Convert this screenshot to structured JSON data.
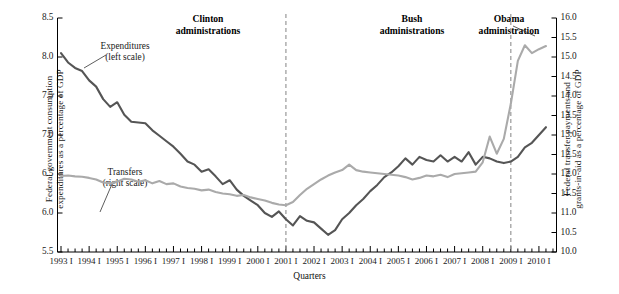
{
  "figure": {
    "xaxis_title": "Quarters"
  },
  "axes": {
    "left": {
      "title_line1": "Federal government consumption",
      "title_line2": "expenditures as a percentage of GDP",
      "ticks": [
        "5.5",
        "6.0",
        "6.5",
        "7.0",
        "7.5",
        "8.0",
        "8.5"
      ]
    },
    "right": {
      "title_line1": "Federal transfer payments and",
      "title_line2": "grants-in-aid as a percentage of GDP",
      "ticks": [
        "10.0",
        "10.5",
        "11.0",
        "11.5",
        "12.0",
        "12.5",
        "13.0",
        "13.5",
        "14.0",
        "14.5",
        "15.0",
        "15.5",
        "16.0"
      ]
    },
    "x": {
      "ticks": [
        "1993 I",
        "1994 I",
        "1995 I",
        "1996 I",
        "1997 I",
        "1998 I",
        "1999 I",
        "2000 I",
        "2001 I",
        "2002 I",
        "2003 I",
        "2004 I",
        "2005 I",
        "2006 I",
        "2007 I",
        "2008 I",
        "2009 I",
        "2010 I"
      ]
    }
  },
  "annotations": {
    "eras": [
      {
        "name": "clinton",
        "line1": "Clinton",
        "line2": "administrations"
      },
      {
        "name": "bush",
        "line1": "Bush",
        "line2": "administrations"
      },
      {
        "name": "obama",
        "line1": "Obama",
        "line2": "administration"
      }
    ],
    "callouts": [
      {
        "name": "expenditures",
        "line1": "Expenditures",
        "line2": "(left scale)"
      },
      {
        "name": "transfers",
        "line1": "Transfers",
        "line2": "(right scale)"
      }
    ],
    "dividers": [
      "2001 I",
      "2009 I"
    ]
  },
  "colors": {
    "expenditures": "#555555",
    "transfers": "#aaaaaa",
    "axis": "#000000",
    "divider": "#999999"
  },
  "chart_data": {
    "type": "line",
    "title": "",
    "xlabel": "Quarters",
    "ylabel": "Federal government consumption expenditures as a percentage of GDP",
    "y2label": "Federal transfer payments and grants-in-aid as a percentage of GDP",
    "ylim": [
      5.5,
      8.5
    ],
    "y2lim": [
      10.0,
      16.0
    ],
    "grid": false,
    "legend": "inline-callouts",
    "x": [
      "1993 I",
      "1993 II",
      "1993 III",
      "1993 IV",
      "1994 I",
      "1994 II",
      "1994 III",
      "1994 IV",
      "1995 I",
      "1995 II",
      "1995 III",
      "1995 IV",
      "1996 I",
      "1996 II",
      "1996 III",
      "1996 IV",
      "1997 I",
      "1997 II",
      "1997 III",
      "1997 IV",
      "1998 I",
      "1998 II",
      "1998 III",
      "1998 IV",
      "1999 I",
      "1999 II",
      "1999 III",
      "1999 IV",
      "2000 I",
      "2000 II",
      "2000 III",
      "2000 IV",
      "2001 I",
      "2001 II",
      "2001 III",
      "2001 IV",
      "2002 I",
      "2002 II",
      "2002 III",
      "2002 IV",
      "2003 I",
      "2003 II",
      "2003 III",
      "2003 IV",
      "2004 I",
      "2004 II",
      "2004 III",
      "2004 IV",
      "2005 I",
      "2005 II",
      "2005 III",
      "2005 IV",
      "2006 I",
      "2006 II",
      "2006 III",
      "2006 IV",
      "2007 I",
      "2007 II",
      "2007 III",
      "2007 IV",
      "2008 I",
      "2008 II",
      "2008 III",
      "2008 IV",
      "2009 I",
      "2009 II",
      "2009 III",
      "2009 IV",
      "2010 I",
      "2010 II"
    ],
    "series": [
      {
        "name": "Expenditures (left scale)",
        "axis": "left",
        "color": "#555555",
        "values": [
          8.05,
          7.93,
          7.86,
          7.82,
          7.7,
          7.62,
          7.46,
          7.36,
          7.42,
          7.26,
          7.17,
          7.16,
          7.15,
          7.06,
          6.99,
          6.92,
          6.85,
          6.76,
          6.66,
          6.62,
          6.53,
          6.56,
          6.47,
          6.37,
          6.42,
          6.3,
          6.22,
          6.16,
          6.1,
          6.0,
          5.95,
          6.02,
          5.92,
          5.84,
          5.96,
          5.9,
          5.88,
          5.8,
          5.72,
          5.78,
          5.92,
          6.0,
          6.1,
          6.18,
          6.28,
          6.36,
          6.46,
          6.52,
          6.6,
          6.7,
          6.62,
          6.72,
          6.68,
          6.66,
          6.74,
          6.66,
          6.72,
          6.66,
          6.78,
          6.62,
          6.72,
          6.7,
          6.66,
          6.64,
          6.66,
          6.72,
          6.84,
          6.9,
          7.0,
          7.1
        ]
      },
      {
        "name": "Transfers (right scale)",
        "axis": "right",
        "color": "#aaaaaa",
        "values": [
          11.95,
          11.96,
          11.94,
          11.93,
          11.9,
          11.86,
          11.78,
          11.76,
          11.8,
          11.88,
          11.86,
          11.8,
          11.84,
          11.76,
          11.82,
          11.74,
          11.76,
          11.68,
          11.64,
          11.62,
          11.58,
          11.6,
          11.54,
          11.5,
          11.48,
          11.44,
          11.46,
          11.4,
          11.36,
          11.32,
          11.26,
          11.22,
          11.2,
          11.28,
          11.46,
          11.62,
          11.74,
          11.86,
          11.96,
          12.04,
          12.1,
          12.24,
          12.1,
          12.06,
          12.04,
          12.02,
          12.0,
          11.98,
          11.96,
          11.92,
          11.86,
          11.9,
          11.96,
          11.94,
          11.98,
          11.92,
          12.0,
          12.02,
          12.04,
          12.06,
          12.3,
          12.96,
          12.52,
          12.9,
          13.8,
          14.9,
          15.3,
          15.1,
          15.2,
          15.28
        ]
      }
    ]
  }
}
